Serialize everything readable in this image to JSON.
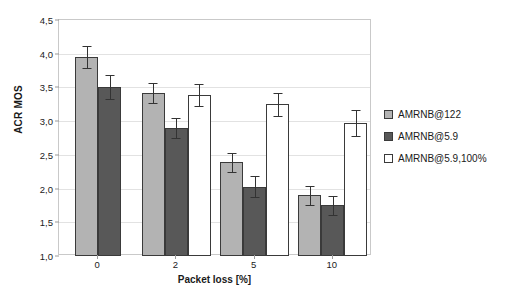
{
  "chart_data": {
    "type": "bar",
    "title": "",
    "xlabel": "Packet loss [%]",
    "ylabel": "ACR MOS",
    "categories": [
      "0",
      "2",
      "5",
      "10"
    ],
    "ylim": [
      1.0,
      4.5
    ],
    "ytick_labels": [
      "1,0",
      "1,5",
      "2,0",
      "2,5",
      "3,0",
      "3,5",
      "4,0",
      "4,5"
    ],
    "ytick_values": [
      1.0,
      1.5,
      2.0,
      2.5,
      3.0,
      3.5,
      4.0,
      4.5
    ],
    "grid": true,
    "legend_position": "right",
    "decimal_separator": ",",
    "error_bar_type": "confidence-interval",
    "series": [
      {
        "name": "AMRNB@122",
        "color": "#b3b3b3",
        "values": [
          3.95,
          3.42,
          2.39,
          1.9
        ],
        "errors": [
          0.16,
          0.15,
          0.14,
          0.14
        ]
      },
      {
        "name": "AMRNB@5.9",
        "color": "#585858",
        "values": [
          3.51,
          2.9,
          2.03,
          1.75
        ],
        "errors": [
          0.18,
          0.15,
          0.16,
          0.14
        ]
      },
      {
        "name": "AMRNB@5.9,100%",
        "color": "#ffffff",
        "values": [
          null,
          3.39,
          3.25,
          2.97
        ],
        "errors": [
          null,
          0.16,
          0.17,
          0.19
        ]
      }
    ]
  },
  "legend": {
    "items": [
      {
        "label": "AMRNB@122"
      },
      {
        "label": "AMRNB@5.9"
      },
      {
        "label": "AMRNB@5.9,100%"
      }
    ]
  },
  "axes": {
    "y_title": "ACR MOS",
    "x_title": "Packet loss [%]"
  }
}
